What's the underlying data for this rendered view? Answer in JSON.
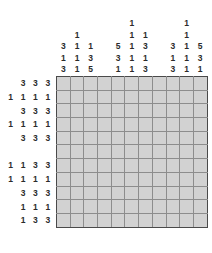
{
  "puzzle": {
    "type": "nonogram",
    "grid_columns": 11,
    "grid_rows": 11,
    "block_size": 5,
    "cell_fill_color": "#d2d2d2",
    "minor_line_color": "#8d8d8d",
    "major_line_color": "#4a4a4a",
    "clue_text_color": "#2b2b2b"
  },
  "column_clues": [
    [
      "3",
      "1",
      "3"
    ],
    [
      "1",
      "1",
      "1",
      "1"
    ],
    [
      "1",
      "3",
      "5"
    ],
    [],
    [
      "5",
      "3",
      "1"
    ],
    [
      "1",
      "1",
      "1",
      "1",
      "1"
    ],
    [
      "1",
      "3",
      "1",
      "3"
    ],
    [],
    [
      "3",
      "1",
      "3"
    ],
    [
      "1",
      "1",
      "1",
      "1",
      "1"
    ],
    [
      "5",
      "3",
      "1"
    ]
  ],
  "row_clues": [
    [
      "3",
      "3",
      "3"
    ],
    [
      "1",
      "1",
      "1",
      "1"
    ],
    [
      "3",
      "3",
      "3"
    ],
    [
      "1",
      "1",
      "1",
      "1"
    ],
    [
      "3",
      "3",
      "3"
    ],
    [],
    [
      "1",
      "1",
      "3",
      "3"
    ],
    [
      "1",
      "1",
      "1",
      "1"
    ],
    [
      "3",
      "3",
      "3"
    ],
    [
      "1",
      "1",
      "1"
    ],
    [
      "1",
      "3",
      "3"
    ]
  ]
}
